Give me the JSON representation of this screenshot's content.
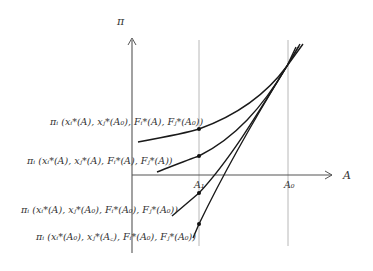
{
  "diagram": {
    "y_axis_label": "π",
    "x_axis_label": "A",
    "tick_labels": {
      "a1": "A₁",
      "a0": "A₀"
    },
    "curves": [
      {
        "id": "curve-1",
        "label": "πᵢ (xᵢ*(A), xⱼ*(A₀), Fᵢ*(A), Fⱼ*(A₀))"
      },
      {
        "id": "curve-2",
        "label": "πᵢ (xᵢ*(A), xⱼ*(A), Fᵢ*(A), Fⱼ*(A))"
      },
      {
        "id": "curve-3",
        "label": "πᵢ (xᵢ*(A), xⱼ*(A₀), Fᵢ*(A₀), Fⱼ*(A₀))"
      },
      {
        "id": "curve-4",
        "label": "πᵢ (xᵢ*(A₀), xⱼ*(A꜀), Fᵢ*(A₀), Fⱼ*(A₀))"
      }
    ],
    "colors": {
      "curve": "#1a1a1a",
      "axis": "#555555",
      "guide": "#b0b0b0",
      "text": "#333333"
    }
  }
}
